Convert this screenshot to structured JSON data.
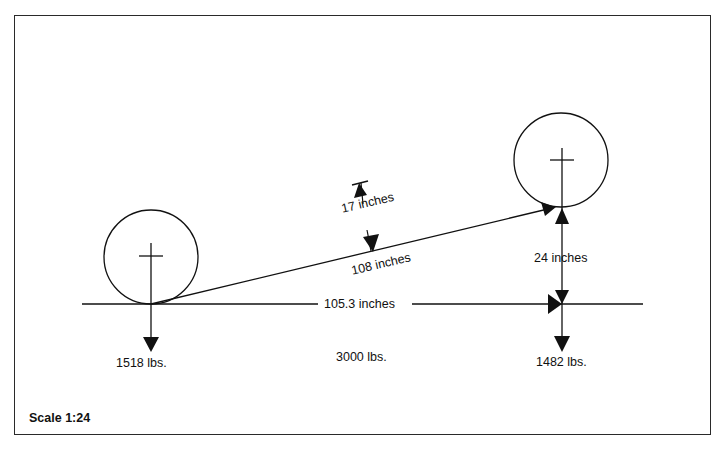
{
  "diagram": {
    "scale_label": "Scale 1:24",
    "wheelbase_label": "105.3 inches",
    "cg_line_label": "108 inches",
    "cg_offset_label": "17 inches",
    "wheel_height_label": "24 inches",
    "front_axle_load": "1518 lbs.",
    "total_weight": "3000 lbs.",
    "rear_axle_load": "1482 lbs.",
    "colors": {
      "line": "#111111",
      "frame": "#2a2a2a",
      "background": "#ffffff"
    }
  }
}
